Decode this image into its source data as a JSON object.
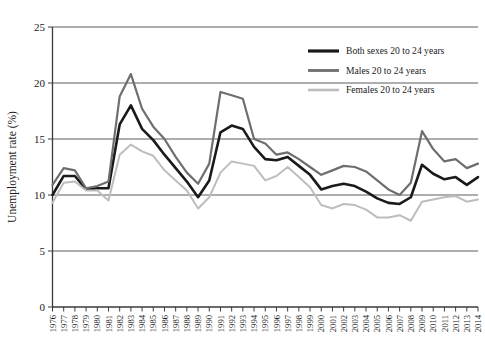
{
  "chart_data": {
    "type": "line",
    "title": "",
    "xlabel": "",
    "ylabel": "Unemployment rate (%)",
    "ylim": [
      0,
      25
    ],
    "yticks": [
      0,
      5,
      10,
      15,
      20,
      25
    ],
    "ytick_labels": [
      "0",
      "5",
      "10",
      "15",
      "20",
      "25"
    ],
    "grid": true,
    "legend_position": "top-right",
    "x": [
      1976,
      1977,
      1978,
      1979,
      1980,
      1981,
      1982,
      1983,
      1984,
      1985,
      1986,
      1987,
      1988,
      1989,
      1990,
      1991,
      1992,
      1993,
      1994,
      1995,
      1996,
      1997,
      1998,
      1999,
      2000,
      2001,
      2002,
      2003,
      2004,
      2005,
      2006,
      2007,
      2008,
      2009,
      2010,
      2011,
      2012,
      2013,
      2014
    ],
    "categories": [
      "1976",
      "1977",
      "1978",
      "1979",
      "1980",
      "1981",
      "1982",
      "1983",
      "1984",
      "1985",
      "1986",
      "1987",
      "1988",
      "1989",
      "1990",
      "1991",
      "1992",
      "1993",
      "1994",
      "1995",
      "1996",
      "1997",
      "1998",
      "1999",
      "2000",
      "2001",
      "2002",
      "2003",
      "2004",
      "2005",
      "2006",
      "2007",
      "2008",
      "2009",
      "2010",
      "2011",
      "2012",
      "2013",
      "2014"
    ],
    "series": [
      {
        "name": "Both sexes 20 to 24 years",
        "color": "#1a1a1a",
        "width": 2.6,
        "values": [
          10.0,
          11.7,
          11.7,
          10.5,
          10.6,
          10.6,
          16.3,
          18.0,
          15.9,
          14.9,
          13.6,
          12.4,
          11.2,
          9.8,
          11.3,
          15.6,
          16.2,
          15.9,
          14.3,
          13.2,
          13.1,
          13.4,
          12.6,
          11.8,
          10.5,
          10.8,
          11.0,
          10.8,
          10.3,
          9.7,
          9.3,
          9.2,
          9.8,
          12.7,
          11.9,
          11.4,
          11.6,
          10.9,
          11.6
        ]
      },
      {
        "name": "Males 20 to 24 years",
        "color": "#6e6e6e",
        "width": 2.2,
        "values": [
          10.9,
          12.4,
          12.2,
          10.6,
          10.8,
          11.2,
          18.8,
          20.8,
          17.7,
          16.1,
          15.0,
          13.4,
          12.0,
          11.0,
          12.8,
          19.2,
          18.9,
          18.6,
          15.0,
          14.6,
          13.6,
          13.8,
          13.2,
          12.5,
          11.8,
          12.2,
          12.6,
          12.5,
          12.1,
          11.3,
          10.5,
          10.0,
          11.1,
          15.7,
          14.1,
          13.0,
          13.2,
          12.4,
          12.8
        ]
      },
      {
        "name": "Females 20 to 24 years",
        "color": "#bdbdbd",
        "width": 2.0,
        "values": [
          9.3,
          11.1,
          11.2,
          10.4,
          10.4,
          9.5,
          13.6,
          14.5,
          13.9,
          13.5,
          12.2,
          11.3,
          10.4,
          8.8,
          9.8,
          12.0,
          13.0,
          12.8,
          12.6,
          11.3,
          11.7,
          12.5,
          11.6,
          10.7,
          9.1,
          8.8,
          9.2,
          9.1,
          8.7,
          8.0,
          8.0,
          8.2,
          7.7,
          9.4,
          9.6,
          9.8,
          9.9,
          9.4,
          9.6
        ]
      }
    ],
    "legend": [
      {
        "label": "Both sexes 20 to 24 years",
        "color": "#1a1a1a"
      },
      {
        "label": "Males 20 to 24 years",
        "color": "#6e6e6e"
      },
      {
        "label": "Females 20 to 24 years",
        "color": "#bdbdbd"
      }
    ]
  }
}
